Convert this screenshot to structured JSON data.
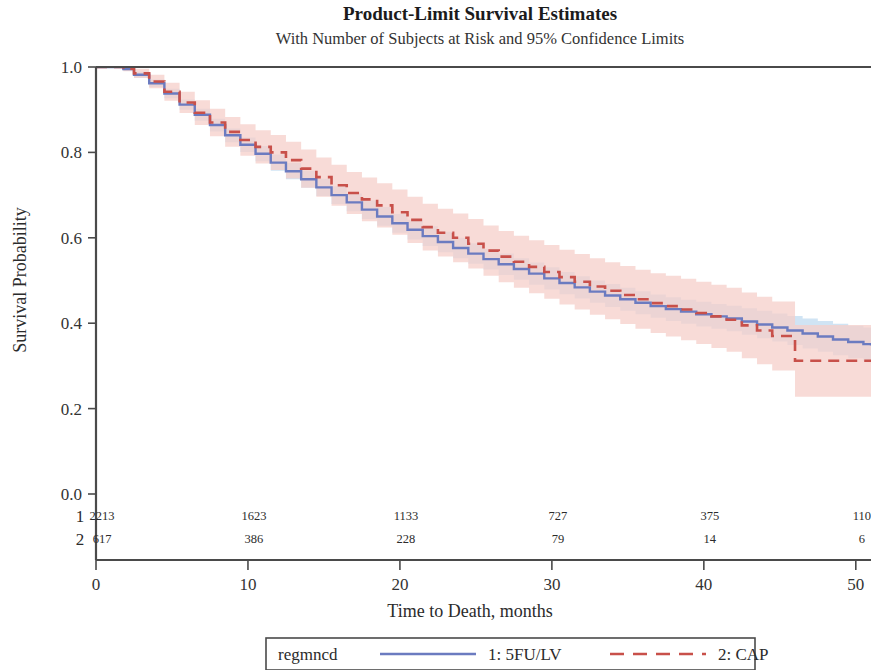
{
  "chart_data": {
    "type": "line",
    "title": "Product-Limit Survival Estimates",
    "subtitle": "With Number of Subjects at Risk and 95% Confidence Limits",
    "xlabel": "Time to Death, months",
    "ylabel": "Survival Probability",
    "xlim": [
      0,
      51
    ],
    "ylim": [
      0.0,
      1.0
    ],
    "xticks": [
      "0",
      "10",
      "20",
      "30",
      "40",
      "50"
    ],
    "xtick_values": [
      0,
      10,
      20,
      30,
      40,
      50
    ],
    "yticks": [
      "0.0",
      "0.2",
      "0.4",
      "0.6",
      "0.8",
      "1.0"
    ],
    "ytick_values": [
      0.0,
      0.2,
      0.4,
      0.6,
      0.8,
      1.0
    ],
    "grid": false,
    "legend_position": "bottom",
    "legend_title": "regmncd",
    "colors": {
      "series1_line": "#6b7bc0",
      "series1_band": "#bcd8f0",
      "series2_line": "#c8504a",
      "series2_band": "#f6cfc9",
      "axis": "#4a4a4a",
      "text": "#2b2b2b"
    },
    "series": [
      {
        "name": "1: 5FU/LV",
        "key": "series1",
        "style": "solid",
        "color": "#6b7bc0",
        "x": [
          0,
          1,
          1.8,
          2.5,
          3.5,
          4.5,
          5.5,
          6.5,
          7.5,
          8.5,
          9.5,
          10.5,
          11.5,
          12.5,
          13.5,
          14.5,
          15.5,
          16.5,
          17.5,
          18.5,
          19.5,
          20.5,
          21.5,
          22.5,
          23.5,
          24.5,
          25.5,
          26.5,
          27.5,
          28.5,
          29.5,
          30.5,
          31.5,
          32.5,
          33.5,
          34.5,
          35.5,
          36.5,
          37.5,
          38.5,
          39.5,
          40.5,
          41.5,
          42.5,
          43.5,
          44.5,
          45.5,
          46.5,
          47.5,
          48.5,
          49.5,
          50.5,
          51
        ],
        "y": [
          1.0,
          1.0,
          0.995,
          0.982,
          0.962,
          0.938,
          0.912,
          0.888,
          0.864,
          0.84,
          0.818,
          0.797,
          0.776,
          0.756,
          0.737,
          0.718,
          0.7,
          0.683,
          0.666,
          0.65,
          0.634,
          0.619,
          0.604,
          0.59,
          0.576,
          0.563,
          0.55,
          0.538,
          0.527,
          0.516,
          0.505,
          0.494,
          0.484,
          0.474,
          0.465,
          0.456,
          0.448,
          0.44,
          0.433,
          0.427,
          0.421,
          0.416,
          0.411,
          0.404,
          0.397,
          0.39,
          0.383,
          0.376,
          0.369,
          0.362,
          0.356,
          0.351,
          0.348
        ],
        "ci_lower": [
          1.0,
          1.0,
          0.991,
          0.975,
          0.953,
          0.927,
          0.9,
          0.874,
          0.849,
          0.824,
          0.801,
          0.779,
          0.757,
          0.737,
          0.717,
          0.698,
          0.679,
          0.662,
          0.644,
          0.628,
          0.612,
          0.596,
          0.581,
          0.566,
          0.552,
          0.539,
          0.526,
          0.513,
          0.502,
          0.49,
          0.479,
          0.468,
          0.458,
          0.448,
          0.438,
          0.429,
          0.421,
          0.413,
          0.405,
          0.399,
          0.392,
          0.387,
          0.381,
          0.373,
          0.365,
          0.357,
          0.349,
          0.341,
          0.333,
          0.325,
          0.318,
          0.312,
          0.308
        ],
        "ci_upper": [
          1.0,
          1.0,
          0.999,
          0.989,
          0.971,
          0.949,
          0.924,
          0.902,
          0.879,
          0.856,
          0.835,
          0.815,
          0.795,
          0.775,
          0.757,
          0.738,
          0.721,
          0.704,
          0.688,
          0.672,
          0.656,
          0.642,
          0.627,
          0.614,
          0.6,
          0.587,
          0.574,
          0.563,
          0.552,
          0.542,
          0.531,
          0.52,
          0.51,
          0.5,
          0.492,
          0.483,
          0.475,
          0.467,
          0.461,
          0.455,
          0.45,
          0.445,
          0.441,
          0.435,
          0.429,
          0.423,
          0.417,
          0.411,
          0.405,
          0.399,
          0.394,
          0.39,
          0.388
        ]
      },
      {
        "name": "2: CAP",
        "key": "series2",
        "style": "dashed",
        "color": "#c8504a",
        "x": [
          0,
          1,
          1.8,
          2.5,
          3.5,
          4.5,
          5.5,
          6.5,
          7.5,
          8.5,
          9.5,
          10.5,
          11.5,
          12.5,
          13.5,
          14.5,
          15.5,
          16.5,
          17.5,
          18.5,
          19.5,
          20.5,
          21.5,
          22.5,
          23.5,
          24.5,
          25.5,
          26.5,
          27.5,
          28.5,
          29.5,
          30.5,
          31.5,
          32.5,
          33.5,
          34.5,
          35.5,
          36.5,
          37.5,
          38.5,
          39.5,
          40.5,
          41.5,
          42.5,
          43.5,
          44.5,
          45.5,
          46,
          47.5,
          49,
          51
        ],
        "y": [
          1.0,
          1.0,
          0.996,
          0.985,
          0.966,
          0.942,
          0.917,
          0.893,
          0.87,
          0.848,
          0.829,
          0.813,
          0.8,
          0.782,
          0.762,
          0.742,
          0.723,
          0.705,
          0.69,
          0.676,
          0.66,
          0.642,
          0.625,
          0.612,
          0.6,
          0.586,
          0.57,
          0.556,
          0.544,
          0.532,
          0.52,
          0.508,
          0.497,
          0.486,
          0.476,
          0.466,
          0.456,
          0.447,
          0.44,
          0.432,
          0.424,
          0.416,
          0.408,
          0.395,
          0.383,
          0.37,
          0.37,
          0.312,
          0.312,
          0.312,
          0.312
        ],
        "ci_lower": [
          1.0,
          1.0,
          0.99,
          0.974,
          0.95,
          0.921,
          0.892,
          0.864,
          0.838,
          0.813,
          0.792,
          0.774,
          0.759,
          0.739,
          0.717,
          0.696,
          0.675,
          0.656,
          0.639,
          0.624,
          0.607,
          0.588,
          0.57,
          0.556,
          0.543,
          0.528,
          0.511,
          0.496,
          0.483,
          0.47,
          0.457,
          0.444,
          0.432,
          0.42,
          0.409,
          0.398,
          0.387,
          0.377,
          0.369,
          0.36,
          0.351,
          0.342,
          0.333,
          0.318,
          0.304,
          0.289,
          0.289,
          0.228,
          0.228,
          0.228,
          0.228
        ],
        "ci_upper": [
          1.0,
          1.0,
          1.0,
          0.996,
          0.982,
          0.963,
          0.942,
          0.922,
          0.902,
          0.883,
          0.866,
          0.852,
          0.841,
          0.825,
          0.807,
          0.788,
          0.771,
          0.754,
          0.741,
          0.728,
          0.713,
          0.696,
          0.68,
          0.668,
          0.657,
          0.644,
          0.629,
          0.616,
          0.605,
          0.594,
          0.583,
          0.572,
          0.562,
          0.552,
          0.543,
          0.534,
          0.525,
          0.517,
          0.511,
          0.504,
          0.497,
          0.49,
          0.483,
          0.472,
          0.462,
          0.451,
          0.451,
          0.396,
          0.396,
          0.396,
          0.396
        ]
      }
    ],
    "risk_table": {
      "times": [
        0,
        10,
        20,
        30,
        40,
        50
      ],
      "rows": [
        {
          "label": "1",
          "counts": [
            "2213",
            "1623",
            "1133",
            "727",
            "375",
            "110"
          ]
        },
        {
          "label": "2",
          "counts": [
            "617",
            "386",
            "228",
            "79",
            "14",
            "6"
          ]
        }
      ]
    },
    "legend": {
      "title": "regmncd",
      "entries": [
        {
          "label": "1: 5FU/LV",
          "style": "solid",
          "color": "#6b7bc0"
        },
        {
          "label": "2: CAP",
          "style": "dashed",
          "color": "#c8504a"
        }
      ]
    }
  }
}
